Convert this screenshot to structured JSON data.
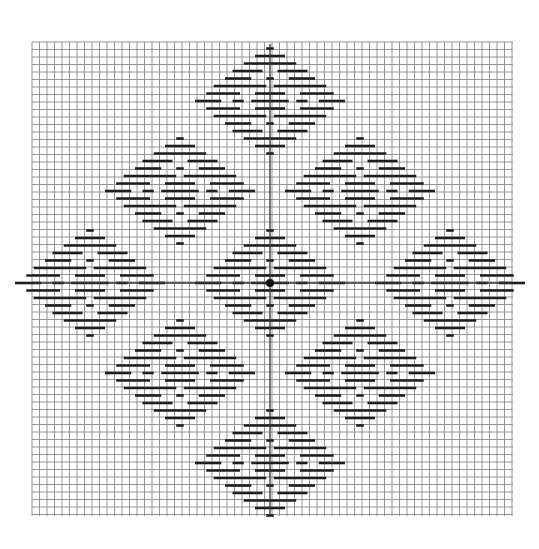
{
  "figure": {
    "background": "#ffffff",
    "grid": {
      "x0": 32,
      "y0": 42,
      "x1": 513,
      "y1": 516,
      "pitch": 7.5,
      "color": "#8a8a8a",
      "width": 0.9
    },
    "axes": {
      "cx": 270,
      "cy": 283,
      "color": "#333333",
      "width": 1.3,
      "v_extent": [
        44,
        514
      ],
      "h_extent": [
        34,
        511
      ]
    },
    "center_dot": {
      "x": 270,
      "y": 283,
      "r": 4,
      "color": "#111111"
    },
    "dash": {
      "color": "#1e1e1e",
      "thickness": 2.6
    },
    "cluster_template": {
      "unit": 7.5,
      "rows": [
        [
          [
            -0.5,
            0.5
          ]
        ],
        [
          [
            -2,
            2
          ]
        ],
        [
          [
            -3.5,
            3.5
          ]
        ],
        [
          [
            -5,
            -1
          ],
          [
            1,
            5
          ]
        ],
        [
          [
            -6,
            -2.5
          ],
          [
            -0.5,
            0.5
          ],
          [
            2.5,
            6
          ]
        ],
        [
          [
            -7.5,
            -0.5
          ],
          [
            0.5,
            7.5
          ]
        ],
        [
          [
            -8.5,
            -4
          ],
          [
            -2,
            2
          ],
          [
            4,
            8.5
          ]
        ],
        [
          [
            -10,
            -6.5
          ],
          [
            -5,
            -3.5
          ],
          [
            -2.5,
            2.5
          ],
          [
            3.5,
            5
          ],
          [
            6.5,
            10
          ]
        ],
        [
          [
            -8.5,
            -4
          ],
          [
            -2,
            2
          ],
          [
            4,
            8.5
          ]
        ],
        [
          [
            -7.5,
            -0.5
          ],
          [
            0.5,
            7.5
          ]
        ],
        [
          [
            -6,
            -2.5
          ],
          [
            -0.5,
            0.5
          ],
          [
            2.5,
            6
          ]
        ],
        [
          [
            -5,
            -1
          ],
          [
            1,
            5
          ]
        ],
        [
          [
            -3.5,
            3.5
          ]
        ],
        [
          [
            -2,
            2
          ]
        ],
        [
          [
            -0.5,
            0.5
          ]
        ]
      ]
    },
    "clusters": [
      {
        "name": "top",
        "cx": 270,
        "cy": 101
      },
      {
        "name": "upper-left",
        "cx": 180,
        "cy": 191
      },
      {
        "name": "upper-right",
        "cx": 360,
        "cy": 191
      },
      {
        "name": "left",
        "cx": 90,
        "cy": 283
      },
      {
        "name": "center",
        "cx": 270,
        "cy": 283
      },
      {
        "name": "right",
        "cx": 450,
        "cy": 283
      },
      {
        "name": "lower-left",
        "cx": 180,
        "cy": 373
      },
      {
        "name": "lower-right",
        "cx": 360,
        "cy": 373
      },
      {
        "name": "bottom",
        "cx": 270,
        "cy": 463
      }
    ]
  }
}
